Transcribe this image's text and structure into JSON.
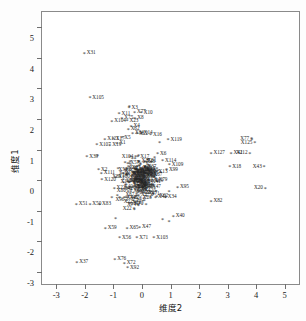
{
  "chart_data": {
    "type": "scatter",
    "title": "",
    "xlabel": "维度2",
    "ylabel": "维度1",
    "xlim": [
      -3.5,
      5.5
    ],
    "ylim": [
      -3.4,
      5.5
    ],
    "xticks": [
      -3,
      -2,
      -1,
      0,
      1,
      2,
      3,
      4,
      5
    ],
    "xticklabels": [
      "-3",
      "-2",
      "-1",
      "0",
      "1",
      "2",
      "3",
      "4",
      "5"
    ],
    "yticks": [
      5,
      4,
      3,
      2,
      1,
      0,
      -1,
      -2,
      -3
    ],
    "yticklabels": [
      "5",
      "4",
      "3",
      "2",
      "1",
      "0",
      "-1",
      "-2",
      "-3"
    ],
    "grid": false,
    "legend": null,
    "marker": "*",
    "marker_color": "#2a2a2a",
    "label_color": "#242424",
    "frame_color": "#8a8a8a",
    "background": "#ffffff",
    "points": [
      {
        "label": "X31",
        "x": -2.02,
        "y": 4.12
      },
      {
        "label": "X105",
        "x": -1.82,
        "y": 2.66
      },
      {
        "label": "X31b",
        "x": -0.44,
        "y": 2.38,
        "show": false
      },
      {
        "label": "X11",
        "x": -0.8,
        "y": 2.14
      },
      {
        "label": "X3",
        "x": -0.45,
        "y": 2.33
      },
      {
        "label": "X77",
        "x": -0.26,
        "y": 2.18
      },
      {
        "label": "X10",
        "x": -0.02,
        "y": 2.17
      },
      {
        "label": "X75",
        "x": -0.7,
        "y": 1.99
      },
      {
        "label": "X8",
        "x": -0.25,
        "y": 1.98
      },
      {
        "label": "X104",
        "x": -1.05,
        "y": 1.88
      },
      {
        "label": "X23",
        "x": -0.52,
        "y": 1.9
      },
      {
        "label": "X4",
        "x": -0.38,
        "y": 1.73
      },
      {
        "label": "X62",
        "x": -0.48,
        "y": 1.62
      },
      {
        "label": "X84",
        "x": -0.33,
        "y": 1.5
      },
      {
        "label": "X22",
        "x": -0.18,
        "y": 1.48
      },
      {
        "label": "X14",
        "x": -0.02,
        "y": 1.49
      },
      {
        "label": "X16",
        "x": 0.3,
        "y": 1.45
      },
      {
        "label": "X121",
        "x": -1.3,
        "y": 1.3
      },
      {
        "label": "X17",
        "x": -1.0,
        "y": 1.32
      },
      {
        "label": "X5",
        "x": -0.7,
        "y": 1.35
      },
      {
        "label": "X119",
        "x": 0.92,
        "y": 1.28
      },
      {
        "label": "X107",
        "x": -1.58,
        "y": 1.12
      },
      {
        "label": "X19",
        "x": -1.12,
        "y": 1.1
      },
      {
        "label": "X1",
        "x": -0.88,
        "y": 1.16
      },
      {
        "label": "X18b",
        "x": 0.62,
        "y": 1.2,
        "show": false
      },
      {
        "label": "X39",
        "x": -1.93,
        "y": 0.72
      },
      {
        "label": "X95b",
        "x": -1.55,
        "y": 0.76,
        "show": false
      },
      {
        "label": "X6",
        "x": 0.55,
        "y": 0.82
      },
      {
        "label": "X2",
        "x": -1.52,
        "y": 0.3
      },
      {
        "label": "X111",
        "x": -1.42,
        "y": 0.18
      },
      {
        "label": "X120",
        "x": -1.4,
        "y": -0.02
      },
      {
        "label": "X114",
        "x": 0.72,
        "y": 0.6
      },
      {
        "label": "X109",
        "x": 0.96,
        "y": 0.46
      },
      {
        "label": "X99",
        "x": 0.86,
        "y": 0.3
      },
      {
        "label": "X27",
        "x": -0.1,
        "y": 0.58
      },
      {
        "label": "X24",
        "x": -0.35,
        "y": 0.34
      },
      {
        "label": "X26",
        "x": -0.12,
        "y": 0.28
      },
      {
        "label": "X13",
        "x": 0.5,
        "y": 0.24
      },
      {
        "label": "X95",
        "x": 1.25,
        "y": -0.28
      },
      {
        "label": "X23b",
        "x": 0.95,
        "y": -0.42,
        "show": false
      },
      {
        "label": "X64",
        "x": -0.3,
        "y": -0.28
      },
      {
        "label": "X22b",
        "x": 0.05,
        "y": -0.34,
        "show": false
      },
      {
        "label": "X51",
        "x": -2.3,
        "y": -0.82
      },
      {
        "label": "X50",
        "x": -1.82,
        "y": -0.82
      },
      {
        "label": "X83",
        "x": -1.48,
        "y": -0.82
      },
      {
        "label": "X84b",
        "x": -1.05,
        "y": -0.6,
        "show": false
      },
      {
        "label": "X44",
        "x": -0.62,
        "y": -0.62
      },
      {
        "label": "X41",
        "x": 0.48,
        "y": -0.6
      },
      {
        "label": "X34",
        "x": 0.82,
        "y": -0.6
      },
      {
        "label": "X82",
        "x": 2.42,
        "y": -0.72
      },
      {
        "label": "X40",
        "x": 1.1,
        "y": -1.22
      },
      {
        "label": "X37b",
        "x": 0.72,
        "y": -1.32,
        "show": false
      },
      {
        "label": "X31c",
        "x": 0.95,
        "y": -1.38,
        "show": false
      },
      {
        "label": "X34b",
        "x": -0.92,
        "y": -1.28,
        "show": false
      },
      {
        "label": "X59",
        "x": -1.28,
        "y": -1.62
      },
      {
        "label": "X65",
        "x": -0.52,
        "y": -1.62
      },
      {
        "label": "X47",
        "x": -0.08,
        "y": -1.58
      },
      {
        "label": "X56",
        "x": -0.78,
        "y": -1.92
      },
      {
        "label": "X71",
        "x": -0.18,
        "y": -1.92
      },
      {
        "label": "X103",
        "x": 0.42,
        "y": -1.92
      },
      {
        "label": "X37",
        "x": -2.28,
        "y": -2.72
      },
      {
        "label": "X76",
        "x": -0.95,
        "y": -2.62
      },
      {
        "label": "X72",
        "x": -0.62,
        "y": -2.76
      },
      {
        "label": "X92",
        "x": -0.5,
        "y": -2.9
      },
      {
        "label": "X77b",
        "x": 3.85,
        "y": 1.3,
        "show": false
      },
      {
        "label": "X77r",
        "x": 3.84,
        "y": 1.32
      },
      {
        "label": "X125",
        "x": 3.95,
        "y": 1.18
      },
      {
        "label": "X127",
        "x": 2.42,
        "y": 0.85
      },
      {
        "label": "X42",
        "x": 3.12,
        "y": 0.85
      },
      {
        "label": "X112",
        "x": 3.78,
        "y": 0.85
      },
      {
        "label": "X18",
        "x": 3.08,
        "y": 0.4
      },
      {
        "label": "X43",
        "x": 4.28,
        "y": 0.4
      },
      {
        "label": "X20",
        "x": 4.32,
        "y": -0.3
      }
    ],
    "cluster_points_count": 200
  }
}
